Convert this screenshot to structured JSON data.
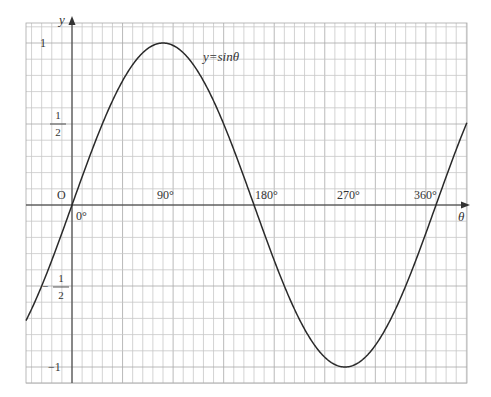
{
  "chart_data": {
    "type": "line",
    "title": "y=sinθ",
    "xlabel": "θ",
    "ylabel": "y",
    "origin_label": "O",
    "x_tick_labels": [
      "0°",
      "90°",
      "180°",
      "270°",
      "360°"
    ],
    "x_ticks_deg": [
      0,
      90,
      180,
      270,
      360
    ],
    "y_tick_labels": [
      {
        "value": 1,
        "label": "1"
      },
      {
        "value": 0.5,
        "label": "1/2",
        "num": "1",
        "den": "2"
      },
      {
        "value": -0.5,
        "label": "-1/2",
        "num": "1",
        "den": "2",
        "sign": "−"
      },
      {
        "value": -1,
        "label": "−1"
      }
    ],
    "xlim_deg": [
      -45,
      390
    ],
    "ylim": [
      -1.1,
      1.12
    ],
    "grid": true,
    "series": [
      {
        "name": "y=sinθ",
        "function": "sin",
        "x_start_deg": -45,
        "x_end_deg": 390,
        "x": [
          -45,
          0,
          30,
          90,
          150,
          180,
          210,
          270,
          330,
          360,
          390
        ],
        "values": [
          -0.707,
          0,
          0.5,
          1,
          0.5,
          0,
          -0.5,
          -1,
          -0.5,
          0,
          0.5
        ]
      }
    ],
    "colors": {
      "curve": "#2a2a2a",
      "axis": "#333333",
      "grid": "#c8c8c8",
      "grid_major": "#a8a8a8"
    }
  }
}
